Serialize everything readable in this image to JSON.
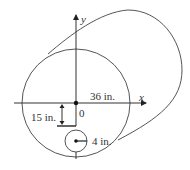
{
  "figure": {
    "type": "pipe cross-section with offset hole",
    "axes": {
      "x_label": "x",
      "y_label": "y",
      "origin_label": "0"
    },
    "dimensions": {
      "outer_radius": "36 in.",
      "hole_offset": "15 in.",
      "hole_radius": "4 in."
    },
    "colors": {
      "stroke": "#555555",
      "text": "#333333"
    }
  }
}
